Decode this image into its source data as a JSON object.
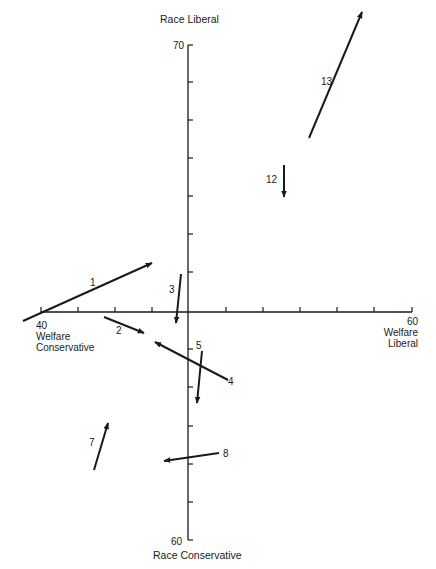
{
  "chart_data": {
    "type": "arrow-vector-plot",
    "title": "",
    "x_axis": {
      "range": [
        40,
        60
      ],
      "center": 50,
      "min_label": "40",
      "max_label": "60",
      "min_caption": "Welfare Conservative",
      "max_caption": "Welfare Liberal",
      "tick_step": 2
    },
    "y_axis": {
      "min_label": "60",
      "max_label": "70",
      "max_caption": "Race Liberal",
      "min_caption": "Race Conservative"
    },
    "arrows": [
      {
        "id": "1",
        "from": [
          23,
          321
        ],
        "to": [
          152,
          263
        ],
        "label_pos": [
          93,
          283
        ]
      },
      {
        "id": "2",
        "from": [
          104,
          317
        ],
        "to": [
          144,
          333
        ],
        "label_pos": [
          119,
          331
        ]
      },
      {
        "id": "3",
        "from": [
          181,
          274
        ],
        "to": [
          176,
          323
        ],
        "label_pos": [
          172,
          290
        ]
      },
      {
        "id": "4",
        "from": [
          228,
          380
        ],
        "to": [
          155,
          342
        ],
        "label_pos": [
          231,
          382
        ]
      },
      {
        "id": "5",
        "from": [
          202,
          351
        ],
        "to": [
          197,
          403
        ],
        "label_pos": [
          199,
          346
        ]
      },
      {
        "id": "7",
        "from": [
          94,
          470
        ],
        "to": [
          108,
          423
        ],
        "label_pos": [
          92,
          443
        ]
      },
      {
        "id": "8",
        "from": [
          219,
          453
        ],
        "to": [
          164,
          461
        ],
        "label_pos": [
          226,
          454
        ]
      },
      {
        "id": "12",
        "from": [
          284,
          165
        ],
        "to": [
          284,
          197
        ],
        "label_pos": [
          269,
          180
        ]
      },
      {
        "id": "13",
        "from": [
          309,
          138
        ],
        "to": [
          362,
          12
        ],
        "label_pos": [
          324,
          82
        ]
      }
    ]
  },
  "labels": {
    "race_liberal": "Race Liberal",
    "y_max": "70",
    "y_min": "60",
    "race_conservative": "Race Conservative",
    "x_min": "40",
    "x_max": "60",
    "welfare_conservative_1": "Welfare",
    "welfare_conservative_2": "Conservative",
    "welfare_liberal_1": "Welfare",
    "welfare_liberal_2": "Liberal"
  },
  "layout": {
    "axis_x": 188,
    "axis_y": 312,
    "h_start": 41,
    "h_end": 412,
    "h_ticks": [
      41,
      78,
      115,
      152,
      226,
      263,
      300,
      337,
      374,
      412
    ],
    "v_start": 45,
    "v_end": 540,
    "v_ticks": [
      45,
      82,
      120,
      158,
      196,
      234,
      272,
      349,
      387,
      426,
      464,
      502,
      540
    ],
    "color": "#1a1a1a"
  }
}
